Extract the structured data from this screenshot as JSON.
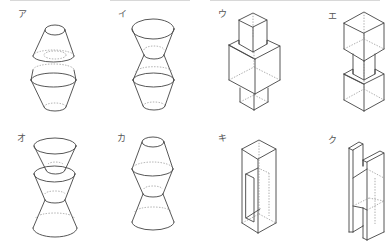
{
  "diagram": {
    "type": "solid-figures-choice-grid",
    "layout": {
      "rows": 2,
      "columns": 4
    },
    "figures": [
      {
        "label": "ア",
        "description": "truncated cone (narrow top) resting on a bi-frustum (wide middle, narrow bottom), with a gap between"
      },
      {
        "label": "イ",
        "description": "inverted frustum on top of a bi-frustum, touching at narrow waist"
      },
      {
        "label": "ウ",
        "description": "small cube on top of a large cube on top of a small cube"
      },
      {
        "label": "エ",
        "description": "large cube on top of a small cube on top of a large cube"
      },
      {
        "label": "オ",
        "description": "inverted frustum nested above inverted frustum, touching an upright frustum at waist"
      },
      {
        "label": "カ",
        "description": "bi-frustum (narrow top, wide middle) on top of an upright frustum touching at waist"
      },
      {
        "label": "キ",
        "description": "tall rectangular box with a rectangular window cut through one face"
      },
      {
        "label": "ク",
        "description": "H-shaped prism made of two vertical slabs joined by a middle section"
      }
    ]
  }
}
